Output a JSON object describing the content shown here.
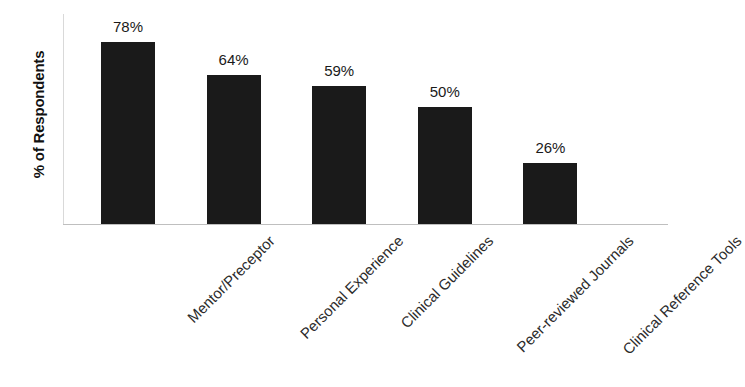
{
  "chart_data": {
    "type": "bar",
    "title": "",
    "subtitle": "",
    "xlabel": "",
    "ylabel": "% of Respondents",
    "categories": [
      "Mentor/Preceptor",
      "Personal Experience",
      "Clinical Guidelines",
      "Peer-reviewed Journals",
      "Clinical Reference Tools"
    ],
    "values": [
      78,
      64,
      59,
      50,
      26
    ],
    "data_labels": [
      "78%",
      "64%",
      "59%",
      "50%",
      "26%"
    ],
    "ylim": [
      0,
      90
    ],
    "ytick_step": 10,
    "yticks": [
      90,
      80,
      70,
      60,
      50,
      40,
      30,
      20,
      10,
      0
    ],
    "ytick_labels": [
      "90",
      "80",
      "70",
      "60",
      "50",
      "40",
      "30",
      "20",
      "10",
      "0"
    ],
    "grid": false,
    "legend": false,
    "legend_position": "none",
    "bar_color": "#1a1a1a",
    "axis_color": "#bfbfbf",
    "background_color": "#ffffff",
    "category_label_rotation": -45
  }
}
